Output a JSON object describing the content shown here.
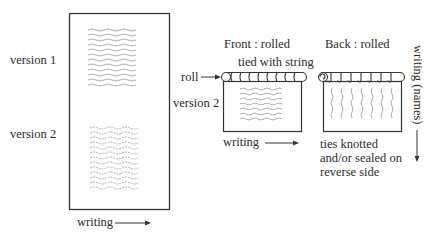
{
  "left_panel": {
    "version1_label": "version 1",
    "version2_label": "version 2",
    "writing_label": "writing"
  },
  "front_panel": {
    "title": "Front : rolled",
    "tie_label": "tied with string",
    "roll_label": "roll",
    "version_label": "version 2",
    "writing_label": "writing"
  },
  "back_panel": {
    "title": "Back : rolled",
    "note_lines": [
      "ties knotted",
      "and/or sealed on",
      "reverse side"
    ],
    "vertical_label": "writing (names)"
  },
  "colors": {
    "line": "#333333",
    "scribble": "#9a9a9a"
  }
}
